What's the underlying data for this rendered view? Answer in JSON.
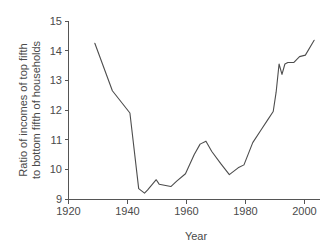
{
  "chart_data": {
    "type": "line",
    "title": "",
    "xlabel": "Year",
    "ylabel": "Ratio of incomes of top fifth to bottom fifth of households",
    "ylabel_line1": "Ratio of incomes of top fifth",
    "ylabel_line2": "to bottom fifth of households",
    "xlim": [
      1920,
      2006
    ],
    "ylim": [
      9,
      15
    ],
    "xticks": [
      1920,
      1940,
      1960,
      1980,
      2000
    ],
    "xtick_labels": [
      "1920",
      "1940",
      "1960",
      "1980",
      "2000"
    ],
    "yticks": [
      9,
      10,
      11,
      12,
      13,
      14,
      15
    ],
    "ytick_labels": [
      "9",
      "10",
      "11",
      "12",
      "13",
      "14",
      "15"
    ],
    "grid": false,
    "legend": "none",
    "line_color": "#4d4d4d",
    "background_color": "#ffffff",
    "series": [
      {
        "name": "Ratio of incomes of top fifth to bottom fifth of households",
        "x": [
          1929,
          1935,
          1941,
          1944,
          1946,
          1947,
          1950,
          1951,
          1955,
          1957,
          1960,
          1963,
          1965,
          1967,
          1969,
          1972,
          1975,
          1978,
          1980,
          1983,
          1986,
          1988,
          1990,
          1991,
          1992,
          1993,
          1994,
          1995,
          1997,
          1999,
          2001,
          2004
        ],
        "y": [
          14.25,
          12.65,
          11.9,
          9.35,
          9.2,
          9.3,
          9.65,
          9.5,
          9.42,
          9.6,
          9.85,
          10.5,
          10.85,
          10.95,
          10.6,
          10.2,
          9.82,
          10.05,
          10.15,
          10.9,
          11.35,
          11.65,
          11.95,
          12.6,
          13.55,
          13.2,
          13.55,
          13.6,
          13.6,
          13.8,
          13.85,
          14.35
        ]
      }
    ]
  }
}
